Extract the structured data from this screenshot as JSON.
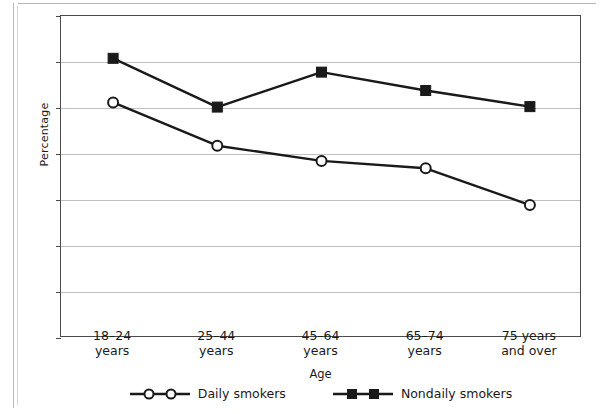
{
  "chart_data": {
    "type": "line",
    "title": "",
    "xlabel": "Age",
    "ylabel": "Percentage",
    "categories": [
      "18–24\nyears",
      "25–44\nyears",
      "45–64\nyears",
      "65–74\nyears",
      "75 years\nand over"
    ],
    "category_lines": [
      [
        "18–24",
        "years"
      ],
      [
        "25–44",
        "years"
      ],
      [
        "45–64",
        "years"
      ],
      [
        "65–74",
        "years"
      ],
      [
        "75 years",
        "and over"
      ]
    ],
    "ylim": [
      0,
      70
    ],
    "yticks": [
      0,
      10,
      20,
      30,
      40,
      50,
      60,
      70
    ],
    "ytick_labels": [
      "0",
      "10",
      "20",
      "30",
      "40",
      "50",
      "60",
      "70"
    ],
    "grid": true,
    "legend_position": "bottom",
    "series": [
      {
        "name": "Daily smokers",
        "marker": "open-circle",
        "values": [
          51.2,
          41.8,
          38.5,
          36.9,
          28.9
        ]
      },
      {
        "name": "Nondaily smokers",
        "marker": "filled-square",
        "values": [
          60.8,
          50.2,
          57.8,
          53.8,
          50.3
        ]
      }
    ]
  },
  "legend": {
    "entries": [
      {
        "label": "Daily smokers"
      },
      {
        "label": "Nondaily smokers"
      }
    ]
  },
  "colors": {
    "line": "#1a1a1a",
    "grid": "#bfbfbf",
    "frame": "#4a4a4a",
    "background": "#ffffff"
  }
}
